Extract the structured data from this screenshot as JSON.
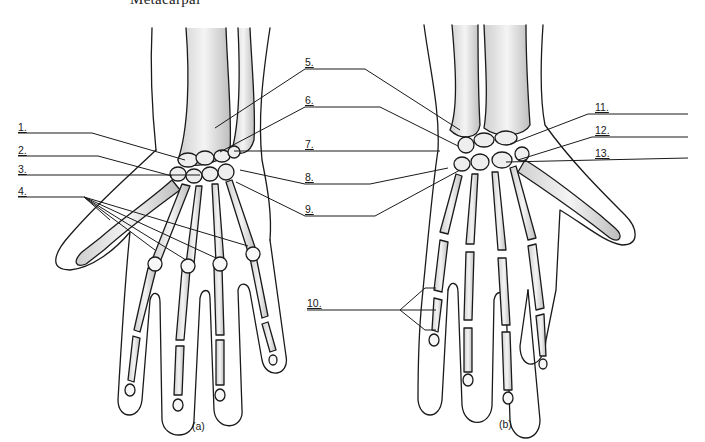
{
  "diagram": {
    "top_caption": "Metacarpal",
    "views": [
      {
        "id": "a",
        "label": "(a)"
      },
      {
        "id": "b",
        "label": "(b)"
      }
    ],
    "labels": [
      {
        "num": "1.",
        "x": 18,
        "y": 125
      },
      {
        "num": "2.",
        "x": 18,
        "y": 148
      },
      {
        "num": "3.",
        "x": 18,
        "y": 166
      },
      {
        "num": "4.",
        "x": 18,
        "y": 188
      },
      {
        "num": "5.",
        "x": 305,
        "y": 59
      },
      {
        "num": "6.",
        "x": 305,
        "y": 97
      },
      {
        "num": "7.",
        "x": 305,
        "y": 141
      },
      {
        "num": "8.",
        "x": 305,
        "y": 174
      },
      {
        "num": "9.",
        "x": 305,
        "y": 206
      },
      {
        "num": "10.",
        "x": 307,
        "y": 300
      },
      {
        "num": "11.",
        "x": 595,
        "y": 104
      },
      {
        "num": "12.",
        "x": 595,
        "y": 127
      },
      {
        "num": "13.",
        "x": 595,
        "y": 150
      }
    ],
    "colors": {
      "ink": "#1a1a1a",
      "bone_shade": "#d8d8d8",
      "background": "#ffffff"
    }
  }
}
